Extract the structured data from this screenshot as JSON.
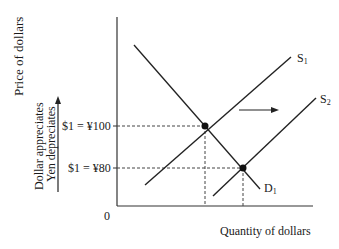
{
  "diagram": {
    "y_axis_label": "Price of dollars",
    "x_axis_label": "Quantity of dollars",
    "origin_label": "0",
    "direction_labels": [
      "Dollar appreciates",
      "Yen depreciates"
    ],
    "price_levels": [
      {
        "label": "$1 = ¥100",
        "y": 126
      },
      {
        "label": "$1 = ¥80",
        "y": 168
      }
    ],
    "curves": {
      "demand": {
        "name": "D",
        "sub": "1"
      },
      "supply1": {
        "name": "S",
        "sub": "1"
      },
      "supply2": {
        "name": "S",
        "sub": "2"
      }
    },
    "shift_arrow": "rightward shift of supply"
  }
}
